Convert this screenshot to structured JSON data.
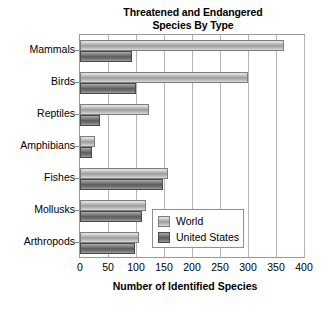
{
  "chart_data": {
    "type": "bar",
    "orientation": "horizontal",
    "title": "Threatened and Endangered Species By Type",
    "title_lines": [
      "Threatened and Endangered",
      "Species By Type"
    ],
    "xlabel": "Number of Identified Species",
    "ylabel": "",
    "xlim": [
      0,
      400
    ],
    "xticks": [
      0,
      50,
      100,
      150,
      200,
      250,
      300,
      350,
      400
    ],
    "xtick_labels": [
      "0",
      "50",
      "100",
      "150",
      "200",
      "250",
      "300",
      "350",
      "400"
    ],
    "grid": "vertical",
    "legend_position": "center-right-inside",
    "categories": [
      "Mammals",
      "Birds",
      "Reptiles",
      "Amphibians",
      "Fishes",
      "Mollusks",
      "Arthropods"
    ],
    "series": [
      {
        "name": "World",
        "color": "#b9b9b9",
        "values": [
          365,
          300,
          124,
          27,
          157,
          117,
          105
        ]
      },
      {
        "name": "United States",
        "color": "#6e6e6e",
        "values": [
          92,
          100,
          35,
          22,
          148,
          110,
          98
        ]
      }
    ]
  },
  "legend": {
    "items": [
      {
        "label": "World",
        "swatch": "world"
      },
      {
        "label": "United States",
        "swatch": "us"
      }
    ]
  },
  "colors": {
    "world_bar": "#b9b9b9",
    "us_bar": "#6e6e6e",
    "gridline": "#b4b4b4",
    "axis": "#9a9a9a",
    "text": "#000000",
    "background": "#ffffff"
  }
}
